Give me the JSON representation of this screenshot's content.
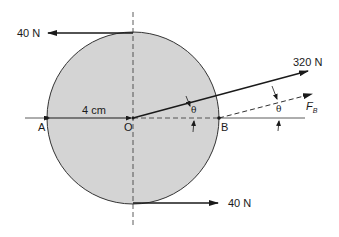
{
  "diagram": {
    "disk": {
      "fill": "#d4d4d4",
      "stroke": "#333333"
    },
    "labels": {
      "force_top": "40 N",
      "force_bottom": "40 N",
      "force_oblique": "320 N",
      "force_b_main": "F",
      "force_b_sub": "B",
      "radius": "4 cm",
      "point_a": "A",
      "point_o": "O",
      "point_b": "B",
      "angle_inner": "θ",
      "angle_outer": "θ"
    }
  }
}
